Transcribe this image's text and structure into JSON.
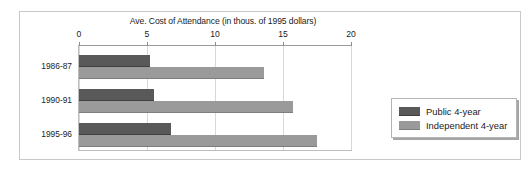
{
  "figure": {
    "title": "Ave. Cost of Attendance (in thous. of 1995 dollars)",
    "axis_ticks": [
      "0",
      "5",
      "10",
      "15",
      "20"
    ],
    "categories": [
      "1986-87",
      "1990-91",
      "1995-96"
    ],
    "legend": {
      "entries": [
        {
          "label": "Public 4-year",
          "color": "#595959",
          "swatch_name": "legend-swatch-public"
        },
        {
          "label": "Independent 4-year",
          "color": "#9a9a9a",
          "swatch_name": "legend-swatch-independent"
        }
      ]
    }
  },
  "chart_data": {
    "type": "bar",
    "orientation": "horizontal",
    "title": "Ave. Cost of Attendance (in thous. of 1995 dollars)",
    "xlabel": "Ave. Cost of Attendance (in thous. of 1995 dollars)",
    "ylabel": "",
    "categories": [
      "1986-87",
      "1990-91",
      "1995-96"
    ],
    "series": [
      {
        "name": "Public 4-year",
        "color": "#595959",
        "values": [
          5.2,
          5.5,
          6.8
        ]
      },
      {
        "name": "Independent 4-year",
        "color": "#9a9a9a",
        "values": [
          13.6,
          15.7,
          17.5
        ]
      }
    ],
    "xlim": [
      0,
      20
    ],
    "xticks": [
      0,
      5,
      10,
      15,
      20
    ],
    "grid": true,
    "legend_position": "right"
  }
}
